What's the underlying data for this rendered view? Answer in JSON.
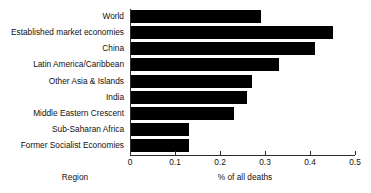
{
  "chart_data": {
    "type": "bar",
    "orientation": "horizontal",
    "title": "",
    "xlabel": "% of all deaths",
    "ylabel": "Region",
    "xlim": [
      0,
      0.5
    ],
    "xticks": [
      "0",
      "0.1",
      "0.2",
      "0.3",
      "0.4",
      "0.5"
    ],
    "xtick_values": [
      0,
      0.1,
      0.2,
      0.3,
      0.4,
      0.5
    ],
    "grid": false,
    "legend": null,
    "bar_color": "#000000",
    "axis_color": "#2b2b2b",
    "categories": [
      "World",
      "Established market economies",
      "China",
      "Latin America/Caribbean",
      "Other Asia & Islands",
      "India",
      "Middle Eastern Crescent",
      "Sub-Saharan Africa",
      "Former Socialist Economies"
    ],
    "values": [
      0.29,
      0.45,
      0.41,
      0.33,
      0.27,
      0.26,
      0.23,
      0.13,
      0.13
    ]
  }
}
